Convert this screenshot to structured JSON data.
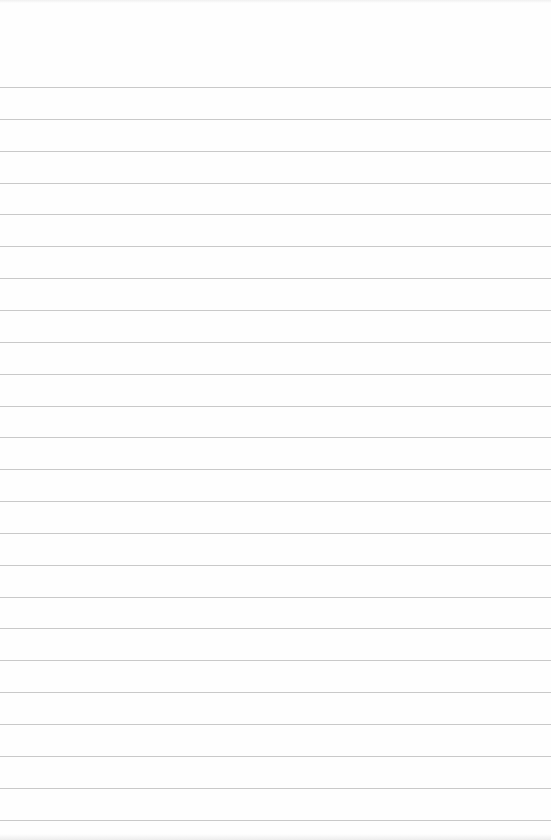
{
  "page": {
    "type": "lined-paper",
    "background_color": "#fefefe",
    "rule_color": "#c9c9c9",
    "rule_count": 24,
    "first_rule_y": 87,
    "rule_spacing": 31.85,
    "text": ""
  }
}
